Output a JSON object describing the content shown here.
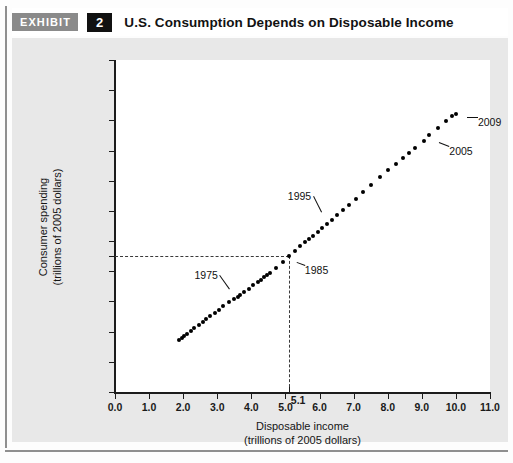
{
  "exhibit": {
    "badge_label": "EXHIBIT",
    "number": "2",
    "title": "U.S. Consumption Depends on Disposable Income"
  },
  "chart_data": {
    "type": "scatter",
    "title": "U.S. Consumption Depends on Disposable Income",
    "xlabel": "Disposable income",
    "xlabel_sub": "(trillions of 2005 dollars)",
    "ylabel": "Consumer spending",
    "ylabel_sub": "(trillions of 2005 dollars)",
    "xlim": [
      0.0,
      11.0
    ],
    "ylim": [
      0.0,
      11.0
    ],
    "xticks": [
      "0.0",
      "1.0",
      "2.0",
      "3.0",
      "4.0",
      "5.0",
      "6.0",
      "7.0",
      "8.0",
      "9.0",
      "10.0",
      "11.0"
    ],
    "yticks": [
      "0.0",
      "1.0",
      "2.0",
      "3.0",
      "4.0",
      "5.0",
      "6.0",
      "7.0",
      "8.0",
      "9.0",
      "10.0",
      "11.0"
    ],
    "extra_ytick": "4.5",
    "extra_xtick": "5.1",
    "grid": false,
    "legend": "none",
    "reference_lines": {
      "x": 5.1,
      "y": 4.5,
      "style": "dashed",
      "note": "1985 reference: disposable income 5.1, consumer spending 4.5"
    },
    "points": [
      {
        "x": 1.89,
        "y": 1.73
      },
      {
        "x": 1.96,
        "y": 1.79
      },
      {
        "x": 2.03,
        "y": 1.85
      },
      {
        "x": 2.12,
        "y": 1.92
      },
      {
        "x": 2.22,
        "y": 2.01
      },
      {
        "x": 2.33,
        "y": 2.11
      },
      {
        "x": 2.45,
        "y": 2.22
      },
      {
        "x": 2.57,
        "y": 2.32
      },
      {
        "x": 2.68,
        "y": 2.42
      },
      {
        "x": 2.8,
        "y": 2.52
      },
      {
        "x": 2.92,
        "y": 2.63
      },
      {
        "x": 3.04,
        "y": 2.73
      },
      {
        "x": 3.18,
        "y": 2.85
      },
      {
        "x": 3.33,
        "y": 2.97
      },
      {
        "x": 3.48,
        "y": 3.08
      },
      {
        "x": 3.6,
        "y": 3.16
      },
      {
        "x": 3.68,
        "y": 3.22
      },
      {
        "x": 3.79,
        "y": 3.31
      },
      {
        "x": 3.93,
        "y": 3.42
      },
      {
        "x": 4.06,
        "y": 3.53
      },
      {
        "x": 4.18,
        "y": 3.63
      },
      {
        "x": 4.28,
        "y": 3.72
      },
      {
        "x": 4.38,
        "y": 3.8
      },
      {
        "x": 4.47,
        "y": 3.86
      },
      {
        "x": 4.55,
        "y": 3.93
      },
      {
        "x": 4.73,
        "y": 4.11
      },
      {
        "x": 4.92,
        "y": 4.3
      },
      {
        "x": 5.1,
        "y": 4.5
      },
      {
        "x": 5.28,
        "y": 4.68
      },
      {
        "x": 5.42,
        "y": 4.83
      },
      {
        "x": 5.56,
        "y": 4.96
      },
      {
        "x": 5.7,
        "y": 5.08
      },
      {
        "x": 5.82,
        "y": 5.18
      },
      {
        "x": 5.94,
        "y": 5.29
      },
      {
        "x": 6.08,
        "y": 5.42
      },
      {
        "x": 6.22,
        "y": 5.56
      },
      {
        "x": 6.36,
        "y": 5.7
      },
      {
        "x": 6.52,
        "y": 5.86
      },
      {
        "x": 6.68,
        "y": 6.02
      },
      {
        "x": 6.86,
        "y": 6.2
      },
      {
        "x": 7.06,
        "y": 6.4
      },
      {
        "x": 7.28,
        "y": 6.63
      },
      {
        "x": 7.52,
        "y": 6.87
      },
      {
        "x": 7.78,
        "y": 7.12
      },
      {
        "x": 8.02,
        "y": 7.36
      },
      {
        "x": 8.24,
        "y": 7.57
      },
      {
        "x": 8.44,
        "y": 7.76
      },
      {
        "x": 8.62,
        "y": 7.92
      },
      {
        "x": 8.8,
        "y": 8.08
      },
      {
        "x": 9.05,
        "y": 8.32
      },
      {
        "x": 9.22,
        "y": 8.5
      },
      {
        "x": 9.48,
        "y": 8.76
      },
      {
        "x": 9.72,
        "y": 8.98
      },
      {
        "x": 9.88,
        "y": 9.14
      },
      {
        "x": 10.0,
        "y": 9.22
      }
    ],
    "annotations": [
      {
        "label": "1975",
        "x": 3.68,
        "y": 3.22
      },
      {
        "label": "1985",
        "x": 5.1,
        "y": 4.5
      },
      {
        "label": "1995",
        "x": 6.36,
        "y": 5.7
      },
      {
        "label": "2005",
        "x": 9.22,
        "y": 8.5
      },
      {
        "label": "2009",
        "x": 10.0,
        "y": 9.22
      }
    ]
  }
}
